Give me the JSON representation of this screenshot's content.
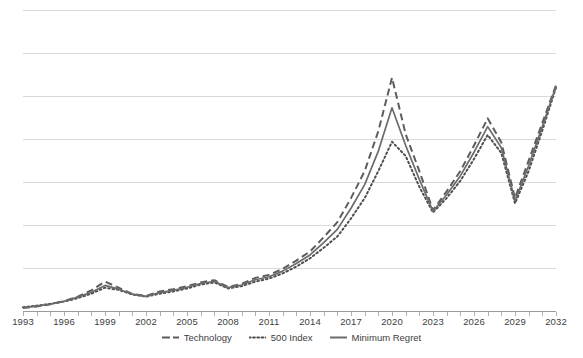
{
  "chart_data": {
    "type": "line",
    "title": "",
    "subtitle": "",
    "xlabel": "",
    "ylabel": "",
    "grid": true,
    "gridlines": 8,
    "legend_position": "bottom-center",
    "xlim": [
      1993,
      2032
    ],
    "ylim": [
      0,
      800
    ],
    "x_tick_labels": [
      "1993",
      "1996",
      "1999",
      "2002",
      "2005",
      "2008",
      "2011",
      "2014",
      "2017",
      "2020",
      "2023",
      "2026",
      "2029",
      "2032"
    ],
    "x_tick_step": 3,
    "y_tick_labels": [],
    "colors": {
      "technology": "#5d5d5d",
      "index500": "#4f4f4f",
      "minimum_regret": "#6b6b6b",
      "gridline": "#d9d9d9",
      "axis": "#9a9a9a",
      "background": "#ffffff",
      "text": "#3d3d3d"
    },
    "x": [
      1993,
      1994,
      1995,
      1996,
      1997,
      1998,
      1999,
      2000,
      2001,
      2002,
      2003,
      2004,
      2005,
      2006,
      2007,
      2008,
      2009,
      2010,
      2011,
      2012,
      2013,
      2014,
      2015,
      2016,
      2017,
      2018,
      2019,
      2020,
      2021,
      2022,
      2023,
      2024,
      2025,
      2026,
      2027,
      2028,
      2029,
      2030,
      2031,
      2032
    ],
    "series": [
      {
        "name": "Technology",
        "style": "dashed",
        "values": [
          8,
          12,
          18,
          26,
          38,
          55,
          78,
          62,
          45,
          40,
          52,
          58,
          66,
          76,
          82,
          64,
          72,
          88,
          96,
          112,
          134,
          158,
          196,
          236,
          300,
          372,
          478,
          620,
          470,
          372,
          268,
          318,
          372,
          440,
          512,
          448,
          300,
          400,
          500,
          600
        ]
      },
      {
        "name": "500 Index",
        "style": "dotted",
        "values": [
          10,
          14,
          19,
          25,
          34,
          46,
          62,
          56,
          44,
          38,
          46,
          52,
          60,
          70,
          76,
          60,
          66,
          78,
          86,
          100,
          118,
          140,
          168,
          198,
          246,
          300,
          372,
          450,
          412,
          330,
          262,
          300,
          346,
          404,
          468,
          420,
          286,
          372,
          480,
          594
        ]
      },
      {
        "name": "Minimum Regret",
        "style": "solid",
        "values": [
          9,
          13,
          18,
          26,
          37,
          50,
          68,
          58,
          45,
          39,
          49,
          55,
          63,
          73,
          79,
          62,
          69,
          83,
          91,
          106,
          126,
          149,
          182,
          217,
          273,
          336,
          425,
          540,
          440,
          350,
          265,
          309,
          359,
          422,
          490,
          434,
          293,
          386,
          490,
          597
        ]
      }
    ],
    "annotations": []
  },
  "legend": {
    "entries": [
      {
        "label": "Technology",
        "style": "dashed",
        "icon": "dashed-line-swatch"
      },
      {
        "label": "500 Index",
        "style": "dotted",
        "icon": "dotted-line-swatch"
      },
      {
        "label": "Minimum Regret",
        "style": "solid",
        "icon": "solid-line-swatch"
      }
    ]
  }
}
